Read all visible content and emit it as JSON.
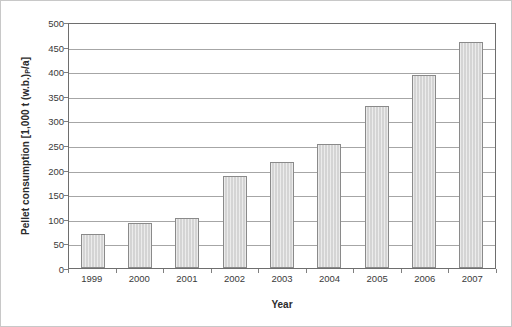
{
  "chart_data": {
    "type": "bar",
    "title": "",
    "xlabel": "Year",
    "ylabel": "Pellet consumption [1,000 t (w.b.)",
    "ylabel_sub": "P",
    "ylabel_tail": "/a]",
    "categories": [
      "1999",
      "2000",
      "2001",
      "2002",
      "2003",
      "2004",
      "2005",
      "2006",
      "2007"
    ],
    "values": [
      70,
      92,
      102,
      188,
      216,
      252,
      330,
      393,
      460
    ],
    "ylim": [
      0,
      500
    ],
    "ytick_values": [
      0,
      50,
      100,
      150,
      200,
      250,
      300,
      350,
      400,
      450,
      500
    ],
    "ytick_labels": [
      "0",
      "50",
      "100",
      "150",
      "200",
      "250",
      "300",
      "350",
      "400",
      "450",
      "500"
    ],
    "grid": true,
    "grid_axis": "y",
    "legend": "none",
    "colors": {
      "bar_fill": "#d4d4d4",
      "bar_border": "#8a8a8a",
      "gridline": "#a6a6a6",
      "axis": "#6e6e6e",
      "text": "#2b2b2b",
      "background": "#ffffff"
    }
  }
}
